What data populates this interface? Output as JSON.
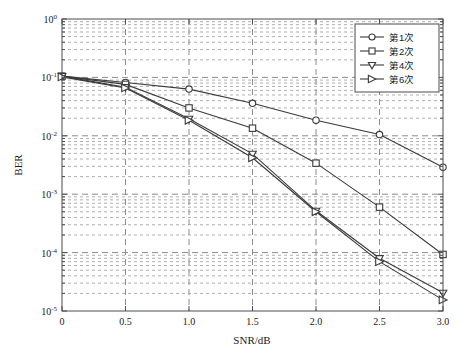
{
  "chart_data": {
    "type": "line",
    "title": "",
    "xlabel": "SNR/dB",
    "ylabel": "BER",
    "xlim": [
      0,
      3.0
    ],
    "ylim": [
      1e-05,
      1
    ],
    "yscale": "log",
    "grid": true,
    "legend_position": "top-right",
    "xticks": [
      "0",
      "0.5",
      "1.0",
      "1.5",
      "2.0",
      "2.5",
      "3.0"
    ],
    "xtick_values": [
      0,
      0.5,
      1.0,
      1.5,
      2.0,
      2.5,
      3.0
    ],
    "yticks": [
      "10^0",
      "10^-1",
      "10^-2",
      "10^-3",
      "10^-4",
      "10^-5"
    ],
    "ytick_mantissa": [
      "10",
      "10",
      "10",
      "10",
      "10",
      "10"
    ],
    "ytick_exponent": [
      "0",
      "-1",
      "-2",
      "-3",
      "-4",
      "-5"
    ],
    "ytick_values": [
      1,
      0.1,
      0.01,
      0.001,
      0.0001,
      1e-05
    ],
    "x": [
      0,
      0.5,
      1.0,
      1.5,
      2.0,
      2.5,
      3.0
    ],
    "series": [
      {
        "name": "第1次",
        "marker": "circle",
        "color": "#3a3a3a",
        "values": [
          0.105,
          0.082,
          0.063,
          0.036,
          0.0185,
          0.0105,
          0.0029
        ]
      },
      {
        "name": "第2次",
        "marker": "square",
        "color": "#3a3a3a",
        "values": [
          0.105,
          0.076,
          0.03,
          0.0135,
          0.0034,
          0.0006,
          9.3e-05
        ]
      },
      {
        "name": "第4次",
        "marker": "triangle-down",
        "color": "#3a3a3a",
        "values": [
          0.105,
          0.068,
          0.0195,
          0.0049,
          0.00052,
          8e-05,
          2.05e-05
        ]
      },
      {
        "name": "第6次",
        "marker": "triangle-right",
        "color": "#3a3a3a",
        "values": [
          0.102,
          0.066,
          0.0185,
          0.0042,
          0.0005,
          7e-05,
          1.55e-05
        ]
      }
    ]
  },
  "legend": {
    "entries": [
      {
        "label": "第1次",
        "marker": "circle"
      },
      {
        "label": "第2次",
        "marker": "square"
      },
      {
        "label": "第4次",
        "marker": "triangle-down"
      },
      {
        "label": "第6次",
        "marker": "triangle-right"
      }
    ]
  },
  "axes": {
    "x_title": "SNR/dB",
    "y_title": "BER"
  }
}
